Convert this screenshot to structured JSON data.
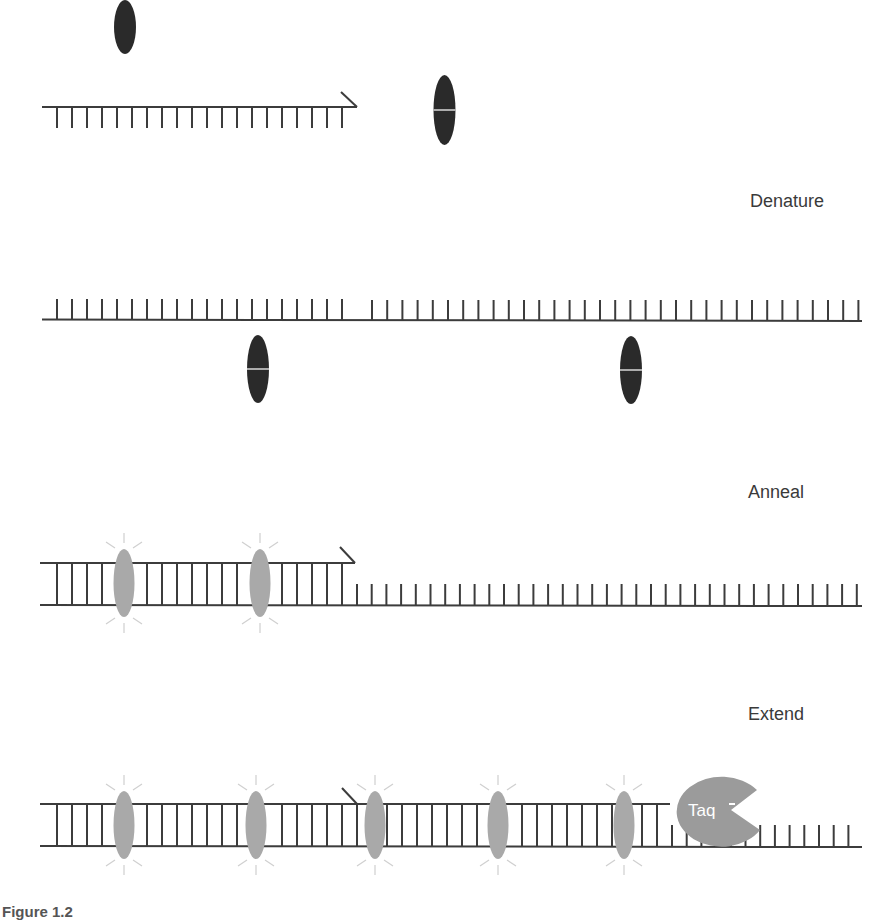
{
  "colors": {
    "background": "#ffffff",
    "strand": "#3c3c3c",
    "probe_dark": "#2a2a2a",
    "probe_quencher_line": "#d8d8d8",
    "probe_released": "#a9a9a9",
    "glow_rays": "#cfcfcf",
    "taq": "#9b9b9b",
    "label_text": "#3a3a3a"
  },
  "steps": [
    {
      "id": "denature",
      "label": "Denature"
    },
    {
      "id": "anneal",
      "label": "Anneal"
    },
    {
      "id": "extend",
      "label": "Extend"
    }
  ],
  "enzyme": {
    "label": "Taq"
  },
  "caption": {
    "text": "Figure 1.2"
  },
  "layout": {
    "section1": {
      "primer_y": 107,
      "primer_x_start": 42,
      "primer_x_end": 357,
      "free_probes_x": [
        125,
        444
      ]
    },
    "section2": {
      "strand_y": 319,
      "strand_x_start": 42,
      "strand_x_end": 862,
      "bound_probes_x": [
        258,
        631
      ]
    },
    "section3": {
      "top_y": 563,
      "bottom_y": 605,
      "released_probes_x": [
        124,
        260
      ]
    },
    "section4": {
      "top_y": 804,
      "bottom_y": 846,
      "released_probes_x": [
        124,
        256,
        375,
        498,
        624
      ],
      "taq_x": 713
    }
  }
}
